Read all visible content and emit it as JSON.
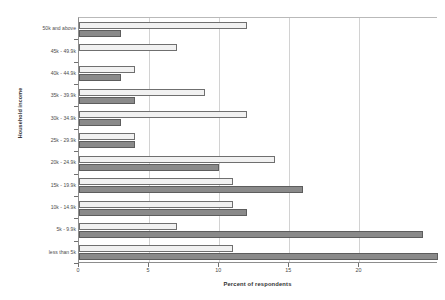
{
  "chart_data": {
    "type": "bar",
    "orientation": "horizontal",
    "title": "",
    "xlabel": "Percent of respondents",
    "ylabel": "Household income",
    "xlim": [
      0,
      25.6
    ],
    "xticks": [
      0,
      5,
      10,
      15,
      20
    ],
    "xticklabels": [
      "0",
      "5",
      "10",
      "15",
      "20"
    ],
    "grid": true,
    "legend": "none",
    "categories": [
      "50k and above",
      "45k - 49.9k",
      "40k - 44.9k",
      "35k - 39.9k",
      "30k - 34.9k",
      "25k - 29.9k",
      "20k - 24.9k",
      "15k - 19.9k",
      "10k - 14.9k",
      "5k - 9.9k",
      "less than 5k"
    ],
    "series": [
      {
        "name": "light",
        "color": "#f1f1f1",
        "values": [
          12,
          7,
          4,
          9,
          12,
          4,
          14,
          11,
          11,
          7,
          11
        ]
      },
      {
        "name": "dark",
        "color": "#8a8a8a",
        "values": [
          3,
          0,
          3,
          4,
          3,
          4,
          10,
          16,
          12,
          24.5,
          25.6
        ]
      }
    ]
  },
  "axes": {
    "y_title": "Household income",
    "x_title": "Percent of respondents"
  }
}
